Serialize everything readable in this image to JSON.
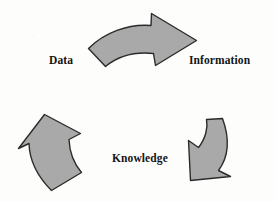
{
  "diagram": {
    "type": "cycle",
    "background_color": "#fdfdfc",
    "arrow_fill": "#a9a9a9",
    "arrow_stroke": "#2b2b2b",
    "text_color": "#141414",
    "labels": [
      {
        "id": "data",
        "text": "Data",
        "x": 49,
        "y": 55
      },
      {
        "id": "information",
        "text": "Information",
        "x": 189,
        "y": 55
      },
      {
        "id": "knowledge",
        "text": "Knowledge",
        "x": 112,
        "y": 153
      }
    ],
    "arrows": [
      {
        "id": "data-to-information",
        "name": "top-arrow",
        "direction": "left-to-right, curving down",
        "points_to": "Information"
      },
      {
        "id": "information-to-knowledge",
        "name": "right-arrow",
        "direction": "top-right to bottom-left",
        "points_to": "Knowledge"
      },
      {
        "id": "knowledge-to-data",
        "name": "left-arrow",
        "direction": "bottom-right to top-left",
        "points_to": "Data"
      }
    ]
  }
}
